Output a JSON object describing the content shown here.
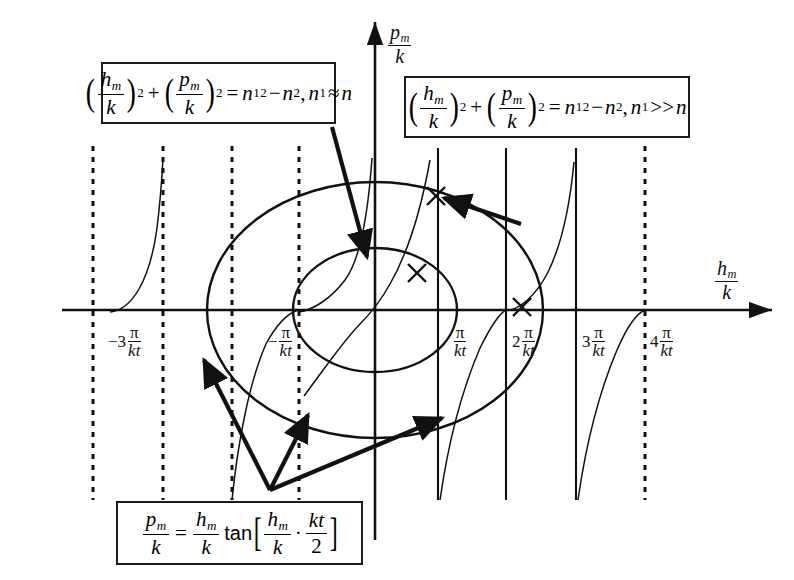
{
  "figure": {
    "background": "#ffffff",
    "line_color": "#111111"
  },
  "axes": {
    "y_axis_label": {
      "numerator": "p",
      "numerator_sub": "m",
      "denominator": "k"
    },
    "x_axis_label": {
      "numerator": "h",
      "numerator_sub": "m",
      "denominator": "k"
    },
    "origin_px": {
      "x": 375,
      "y": 310
    },
    "x_range_label": "-3π/kt to 4π/kt"
  },
  "tick_labels": [
    {
      "name": "tick-minus-3pi-kt",
      "coefficient": "−3",
      "numerator": "π",
      "denominator": "kt",
      "x": 108,
      "y": 328
    },
    {
      "name": "tick-minus-pi-kt",
      "coefficient": "−",
      "numerator": "π",
      "denominator": "kt",
      "x": 268,
      "y": 328
    },
    {
      "name": "tick-pi-kt",
      "coefficient": "",
      "numerator": "π",
      "denominator": "kt",
      "x": 452,
      "y": 328
    },
    {
      "name": "tick-2pi-kt",
      "coefficient": "2",
      "numerator": "π",
      "denominator": "kt",
      "x": 512,
      "y": 328
    },
    {
      "name": "tick-3pi-kt",
      "coefficient": "3",
      "numerator": "π",
      "denominator": "kt",
      "x": 582,
      "y": 328
    },
    {
      "name": "tick-4pi-kt",
      "coefficient": "4",
      "numerator": "π",
      "denominator": "kt",
      "x": 650,
      "y": 328
    }
  ],
  "equation_boxes": [
    {
      "name": "equation-box-circle-n1-approx-n",
      "id": "box1",
      "left": 101,
      "top": 62,
      "width": 235,
      "height": 62,
      "latex": "(h_m/k)^2 + (p_m/k)^2 = n_1^2 - n^2, n_1 ≈ n",
      "parts": {
        "var1_num": "h",
        "var1_sub": "m",
        "var1_den": "k",
        "plus": "+",
        "var2_num": "p",
        "var2_sub": "m",
        "var2_den": "k",
        "equals": "=",
        "rhs": "n",
        "rhs_sub": "1",
        "rhs_sup": "2",
        "minus": "−",
        "rhs2": "n",
        "rhs2_sup": "2",
        "comma": ",",
        "cond_var": "n",
        "cond_sub": "1",
        "cond_rel": "≈",
        "cond_rhs": "n",
        "exp": "2"
      }
    },
    {
      "name": "equation-box-circle-n1-much-greater-n",
      "id": "box2",
      "left": 404,
      "top": 76,
      "width": 286,
      "height": 62,
      "latex": "(h_m/k)^2 + (p_m/k)^2 = n_1^2 - n^2, n_1 >> n",
      "parts": {
        "var1_num": "h",
        "var1_sub": "m",
        "var1_den": "k",
        "plus": "+",
        "var2_num": "p",
        "var2_sub": "m",
        "var2_den": "k",
        "equals": "=",
        "rhs": "n",
        "rhs_sub": "1",
        "rhs_sup": "2",
        "minus": "−",
        "rhs2": "n",
        "rhs2_sup": "2",
        "comma": ",",
        "cond_var": "n",
        "cond_sub": "1",
        "cond_rel": ">>",
        "cond_rhs": "n",
        "exp": "2"
      }
    },
    {
      "name": "equation-box-tangent",
      "id": "box3",
      "left": 116,
      "top": 501,
      "width": 247,
      "height": 64,
      "latex": "p_m/k = (h_m/k) tan[ (h_m/k) . (kt/2) ]",
      "parts": {
        "lhs_num": "p",
        "lhs_sub": "m",
        "lhs_den": "k",
        "equals": "=",
        "var_num": "h",
        "var_sub": "m",
        "var_den": "k",
        "fn": "tan",
        "arg1_num": "h",
        "arg1_sub": "m",
        "arg1_den": "k",
        "dot": "·",
        "arg2_num": "kt",
        "arg2_den": "2"
      }
    }
  ],
  "curves": {
    "circle_outer": {
      "name": "outer-circle",
      "cx": 375,
      "cy": 310,
      "rx": 168,
      "ry": 128,
      "label_ref": "box2"
    },
    "circle_inner": {
      "name": "inner-circle",
      "cx": 375,
      "cy": 310,
      "rx": 82,
      "ry": 62,
      "label_ref": "box1"
    },
    "tangent_branches": 6,
    "tangent_label_ref": "box3"
  },
  "asymptotes": {
    "dashed_x": [
      93,
      163,
      232,
      299,
      645
    ],
    "solid_x": [
      438,
      506,
      576
    ]
  },
  "intersection_marks": [
    {
      "name": "intersection-mark-1",
      "x": 436,
      "y": 196
    },
    {
      "name": "intersection-mark-2",
      "x": 417,
      "y": 273
    },
    {
      "name": "intersection-mark-3",
      "x": 522,
      "y": 307
    }
  ],
  "annotation_arrows": [
    {
      "name": "arrow-box1-to-inner-circle",
      "from": [
        332,
        127
      ],
      "to": [
        367,
        257
      ]
    },
    {
      "name": "arrow-box2-to-outer-circle",
      "from": [
        521,
        224
      ],
      "to": [
        444,
        198
      ]
    },
    {
      "name": "arrow-tangent-to-left-branch",
      "from": [
        270,
        490
      ],
      "to": [
        204,
        360
      ]
    },
    {
      "name": "arrow-tangent-to-mid-branch",
      "from": [
        270,
        490
      ],
      "to": [
        308,
        415
      ]
    },
    {
      "name": "arrow-tangent-to-right-branch",
      "from": [
        270,
        490
      ],
      "to": [
        442,
        418
      ]
    }
  ]
}
